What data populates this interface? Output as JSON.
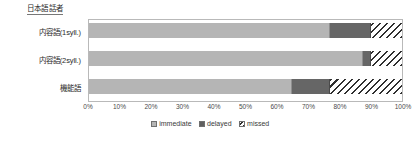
{
  "chart_data": {
    "type": "bar",
    "orientation": "horizontal",
    "stacked": true,
    "normalized": true,
    "title": "日本語話者",
    "xlabel": "",
    "ylabel": "",
    "xlim": [
      0,
      100
    ],
    "grid": false,
    "legend_position": "bottom",
    "categories": [
      "内容語(1syll.)",
      "内容語(2syll.)",
      "機能語"
    ],
    "tick_labels": [
      "0%",
      "10%",
      "20%",
      "30%",
      "40%",
      "50%",
      "60%",
      "70%",
      "80%",
      "90%",
      "100%"
    ],
    "tick_values": [
      0,
      10,
      20,
      30,
      40,
      50,
      60,
      70,
      80,
      90,
      100
    ],
    "series": [
      {
        "name": "immediate",
        "color": "#b5b5b5",
        "pattern": "solid",
        "values": [
          77,
          87.5,
          65
        ]
      },
      {
        "name": "delayed",
        "color": "#666666",
        "pattern": "solid",
        "values": [
          13,
          2.5,
          12
        ]
      },
      {
        "name": "missed",
        "color": "#2f2f2f",
        "pattern": "diagonal-hatch",
        "values": [
          10,
          10,
          23
        ]
      }
    ]
  },
  "legend": {
    "items": [
      {
        "label": "immediate",
        "swatch": "legend-swatch-immediate"
      },
      {
        "label": "delayed",
        "swatch": "legend-swatch-delayed"
      },
      {
        "label": "missed",
        "swatch": "legend-swatch-missed"
      }
    ]
  }
}
